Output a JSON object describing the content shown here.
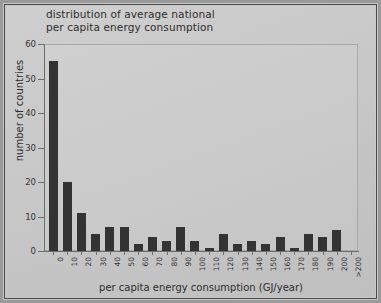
{
  "figure": {
    "title_line1": "distribution of average national",
    "title_line2": "per capita energy consumption",
    "title": "distribution of average national\nper capita energy consumption"
  },
  "chart_data": {
    "type": "bar",
    "title": "distribution of average national per capita energy consumption",
    "xlabel": "per capita energy consumption (GJ/year)",
    "ylabel": "number of countries",
    "categories": [
      "0",
      "10",
      "20",
      "30",
      "40",
      "50",
      "60",
      "70",
      "80",
      "90",
      "100",
      "110",
      "120",
      "130",
      "140",
      "150",
      "160",
      "170",
      "180",
      "190",
      "200",
      ">200"
    ],
    "values": [
      55,
      20,
      11,
      5,
      7,
      7,
      2,
      4,
      3,
      7,
      3,
      1,
      5,
      2,
      3,
      2,
      4,
      1,
      5,
      4,
      6,
      0
    ],
    "ylim": [
      0,
      60
    ],
    "yticks": [
      0,
      10,
      20,
      30,
      40,
      50,
      60
    ],
    "ytick_labels": [
      "0",
      "10",
      "20",
      "30",
      "40",
      "50",
      "60"
    ],
    "grid": false,
    "legend": "none",
    "bar_color": "#333333",
    "background_color": "#c8c8c8"
  }
}
